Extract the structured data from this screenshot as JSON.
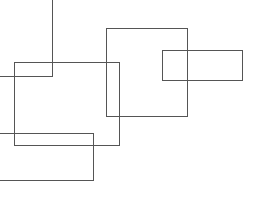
{
  "canvas": {
    "width": 267,
    "height": 221,
    "background": "#ffffff"
  },
  "stroke": {
    "color": "#555555",
    "width": 1
  },
  "shapes": {
    "corner_line": {
      "points": "0,76 52,76 52,0"
    },
    "rect_a": {
      "x": 14,
      "y": 62,
      "w": 105,
      "h": 83
    },
    "rect_b": {
      "x": 106,
      "y": 28,
      "w": 81,
      "h": 88
    },
    "rect_c": {
      "x": 162,
      "y": 50,
      "w": 80,
      "h": 30
    },
    "rect_d": {
      "points": "0,133 93,133 93,180 0,180"
    }
  }
}
